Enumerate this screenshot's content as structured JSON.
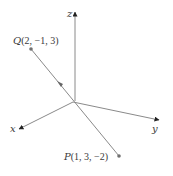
{
  "diagram": {
    "axes": {
      "x_label": "x",
      "y_label": "y",
      "z_label": "z"
    },
    "points": {
      "Q": {
        "name": "Q",
        "coords": "(2, −1, 3)"
      },
      "P": {
        "name": "P",
        "coords": "(1, 3, −2)"
      }
    },
    "colors": {
      "axis": "#8a8a8a",
      "segment": "#8a8a8a",
      "text": "#3a3a3a",
      "dot": "#707070"
    }
  }
}
